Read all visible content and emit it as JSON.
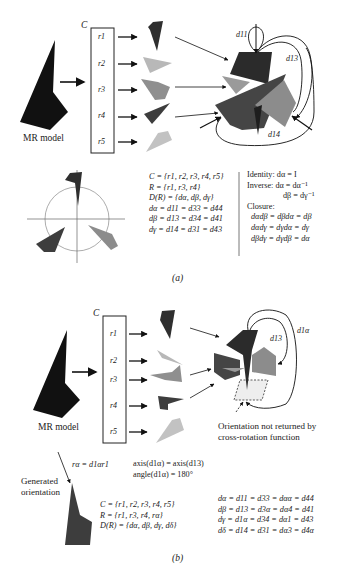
{
  "panel_a": {
    "container_label": "C",
    "rotations": [
      "r1",
      "r2",
      "r3",
      "r4",
      "r5"
    ],
    "model_label": "MR model",
    "edge_labels": {
      "d11": "d11",
      "d13": "d13",
      "d14": "d14"
    },
    "equations_left": [
      "C = {r1, r2, r3, r4, r5}",
      "R = {r1, r3, r4}",
      "D(R) = {dα, dβ, dγ}",
      "dα = d11 = d33 = d44",
      "dβ = d13 = d34 = d41",
      "dγ = d14 = d31 = d43"
    ],
    "identity": "Identity: dα = I",
    "inverse": [
      "Inverse: dα = dα⁻¹",
      "dβ = dγ⁻¹"
    ],
    "closure_title": "Closure:",
    "closure": [
      "dαdβ = dβdα = dβ",
      "dαdγ = dγdα = dγ",
      "dβdγ = dγdβ = dα"
    ],
    "caption": "(a)"
  },
  "panel_b": {
    "container_label": "C",
    "rotations": [
      "r1",
      "r2",
      "r3",
      "r4",
      "r5"
    ],
    "model_label": "MR model",
    "edge_labels": {
      "d13": "d13",
      "d1a": "d1α"
    },
    "missing_note": [
      "Orientation not returned by",
      "cross-rotation function"
    ],
    "generated_label": [
      "Generated",
      "orientation"
    ],
    "ra_eq": "rα = d1αr1",
    "axis_eq": "axis(d1α) = axis(d13)",
    "angle_eq": "angle(d1α) = 180°",
    "equations_left": [
      "C = {r1, r2, r3, r4, r5}",
      "R = {r1, r3, r4, rα}",
      "D(R) = {dα, dβ, dγ, dδ}"
    ],
    "equations_right": [
      "dα = d11 = d33 = dαα = d44",
      "dβ = d13 = d3α = dα4 = d41",
      "dγ = d1α = d34 = dα1 = d43",
      "dδ = d14 = d31 = dα3 = d4α"
    ],
    "caption": "(b)"
  },
  "colors": {
    "black": "#111111",
    "dark_gray": "#3c3c3c",
    "mid_gray": "#8a8a8a",
    "light_gray": "#b9b9b9",
    "pale": "#eeeeee"
  }
}
